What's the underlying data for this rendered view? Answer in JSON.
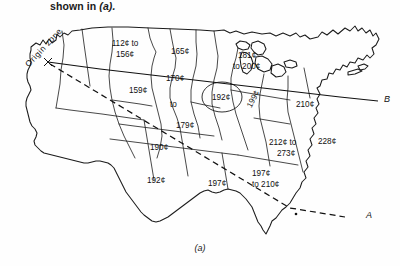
{
  "figure": {
    "caption_top_text": "shown in ",
    "caption_top_italic": "(a).",
    "caption_bottom": "(a)",
    "origin_zone_label": "Origin zone",
    "line_labels": {
      "solid_line_end": "B",
      "dashed_line_end": "A"
    },
    "rate_zones": [
      {
        "id": "pacific-northwest-to-north-central",
        "value": "112¢ to",
        "value2": "156¢"
      },
      {
        "id": "north-central-plains",
        "value": "165¢"
      },
      {
        "id": "mountain-southwest",
        "value": "159¢"
      },
      {
        "id": "central-plains-range-1",
        "value": "170¢"
      },
      {
        "id": "central-plains-range-2",
        "value": "to"
      },
      {
        "id": "central-plains-range-3",
        "value": "179¢"
      },
      {
        "id": "upper-midwest",
        "value": "181¢",
        "value2": "to 200¢"
      },
      {
        "id": "midwest-oval",
        "value": "192¢"
      },
      {
        "id": "ohio-valley",
        "value": "199¢"
      },
      {
        "id": "appalachian-east",
        "value": "210¢"
      },
      {
        "id": "southwest-mountain",
        "value": "190¢"
      },
      {
        "id": "southwest-desert",
        "value": "192¢"
      },
      {
        "id": "south-central",
        "value": "197¢"
      },
      {
        "id": "gulf-coast",
        "value": "197¢",
        "value2": "to  210¢"
      },
      {
        "id": "deep-south",
        "value": "212¢ to",
        "value2": "273¢"
      },
      {
        "id": "southeast-atlantic",
        "value": "228¢"
      }
    ],
    "colors": {
      "ink": "#1b1b1b",
      "background": "#fefefe"
    }
  }
}
